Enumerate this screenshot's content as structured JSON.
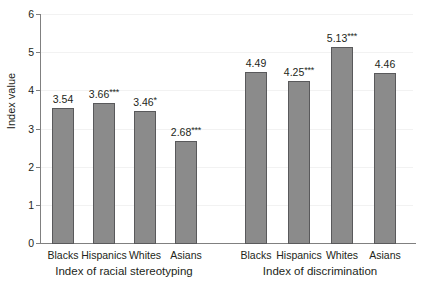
{
  "chart_data": {
    "type": "bar",
    "title": "",
    "xlabel": "",
    "ylabel": "Index value",
    "ylim": [
      0,
      6
    ],
    "ytick_labels": [
      "0",
      "1",
      "2",
      "3",
      "4",
      "5",
      "6"
    ],
    "grid": true,
    "legend": "none",
    "groups": [
      {
        "name": "Index of racial stereotyping",
        "categories": [
          "Blacks",
          "Hispanics",
          "Whites",
          "Asians"
        ],
        "values": [
          3.54,
          3.66,
          3.46,
          2.68
        ],
        "labels": [
          "3.54",
          "3.66***",
          "3.46*",
          "2.68***"
        ],
        "significance": [
          "",
          "***",
          "*",
          "***"
        ]
      },
      {
        "name": "Index of discrimination",
        "categories": [
          "Blacks",
          "Hispanics",
          "Whites",
          "Asians"
        ],
        "values": [
          4.49,
          4.25,
          5.13,
          4.46
        ],
        "labels": [
          "4.49",
          "4.25***",
          "5.13***",
          "4.46"
        ],
        "significance": [
          "",
          "***",
          "***",
          ""
        ]
      }
    ],
    "colors": {
      "bar_fill": "#8b8b8b",
      "bar_border": "#59595b",
      "gridline": "#f2f2f2",
      "axis": "#808080",
      "text": "#231f20",
      "background": "#ffffff"
    }
  }
}
